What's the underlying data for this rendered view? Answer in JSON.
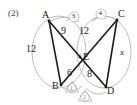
{
  "figure": {
    "problem_number": "(2)",
    "vertices": [
      {
        "id": "A",
        "label": "A",
        "x": 44,
        "y": 15
      },
      {
        "id": "C",
        "label": "C",
        "x": 119,
        "y": 14
      },
      {
        "id": "B",
        "label": "B",
        "x": 56,
        "y": 86
      },
      {
        "id": "D",
        "label": "D",
        "x": 108,
        "y": 91
      },
      {
        "id": "E",
        "label": "E",
        "x": 85,
        "y": 57
      }
    ],
    "segment_labels": [
      {
        "id": "AB",
        "text": "12",
        "x": 31,
        "y": 48
      },
      {
        "id": "AE",
        "text": "9",
        "x": 64,
        "y": 30
      },
      {
        "id": "CE",
        "text": "12",
        "x": 83,
        "y": 30
      },
      {
        "id": "BE",
        "text": "6",
        "x": 69,
        "y": 72
      },
      {
        "id": "ED",
        "text": "8",
        "x": 89,
        "y": 73
      },
      {
        "id": "CD",
        "text": "x",
        "x": 121,
        "y": 52
      }
    ],
    "angle_markers": [
      {
        "id": "marker-3",
        "text": "3",
        "x": 72,
        "y": 14
      },
      {
        "id": "marker-4",
        "text": "4",
        "x": 99,
        "y": 11
      },
      {
        "id": "marker-1",
        "text": "1",
        "x": 71,
        "y": 86
      },
      {
        "id": "marker-2",
        "text": "2",
        "x": 84,
        "y": 95
      }
    ],
    "colors": {
      "stroke_dark": "#1b1b1b",
      "stroke_light": "#b5b0ad",
      "text": "#1b1b1b"
    }
  }
}
